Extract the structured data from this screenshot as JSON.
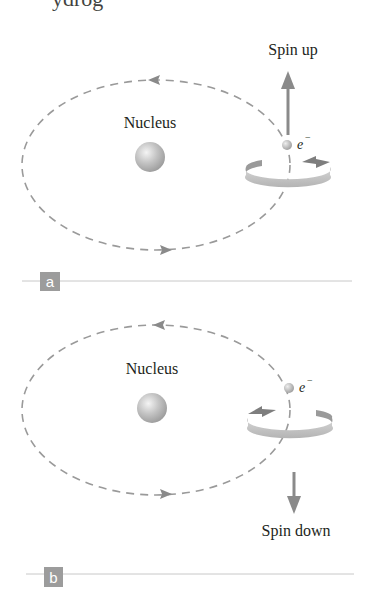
{
  "title_fragment": "ydrog",
  "panels": [
    {
      "id": "a",
      "badge": "a",
      "nucleus_label": "Nucleus",
      "electron_label": "e",
      "electron_charge": "−",
      "spin_label": "Spin up",
      "spin_direction": "up",
      "orbit_direction": "counterclockwise"
    },
    {
      "id": "b",
      "badge": "b",
      "nucleus_label": "Nucleus",
      "electron_label": "e",
      "electron_charge": "−",
      "spin_label": "Spin down",
      "spin_direction": "down",
      "orbit_direction": "counterclockwise"
    }
  ],
  "colors": {
    "orbit": "#9a9a9a",
    "arrow": "#8a8a8a",
    "badge": "#9c9c9c",
    "rule": "#c8c8c8",
    "text": "#231f20"
  }
}
